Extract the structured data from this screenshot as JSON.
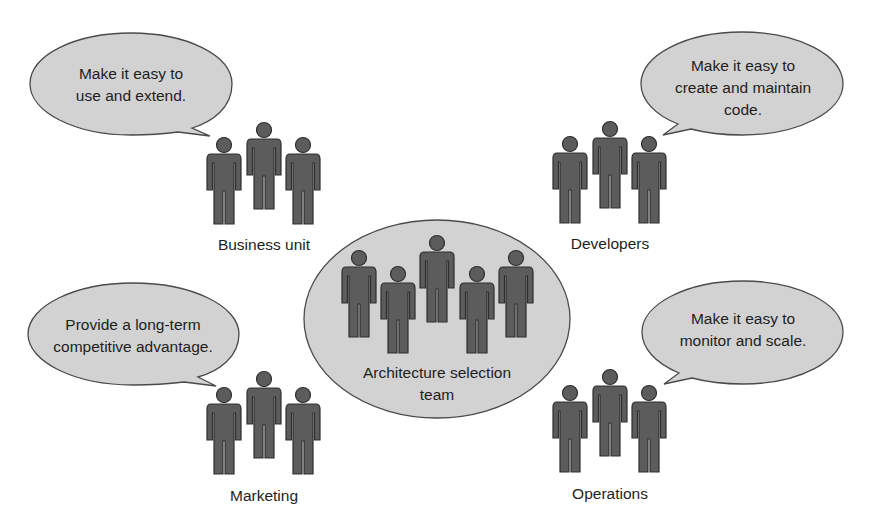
{
  "diagram": {
    "center": {
      "label_line1": "Architecture selection",
      "label_line2": "team",
      "person_count": 5
    },
    "stakeholders": [
      {
        "id": "business-unit",
        "label": "Business unit",
        "quote_line1": "Make it easy to",
        "quote_line2": "use and extend.",
        "quote_line3": ""
      },
      {
        "id": "developers",
        "label": "Developers",
        "quote_line1": "Make it easy to",
        "quote_line2": "create and maintain",
        "quote_line3": "code."
      },
      {
        "id": "marketing",
        "label": "Marketing",
        "quote_line1": "Provide a long-term",
        "quote_line2": "competitive advantage.",
        "quote_line3": ""
      },
      {
        "id": "operations",
        "label": "Operations",
        "quote_line1": "Make it easy to",
        "quote_line2": "monitor and scale.",
        "quote_line3": ""
      }
    ],
    "colors": {
      "bubble_fill": "#d2d2d2",
      "person_fill": "#5c5c5c",
      "outline": "#4a4a4a"
    },
    "icons": {
      "person": "person-icon",
      "speech_bubble": "speech-bubble"
    }
  }
}
